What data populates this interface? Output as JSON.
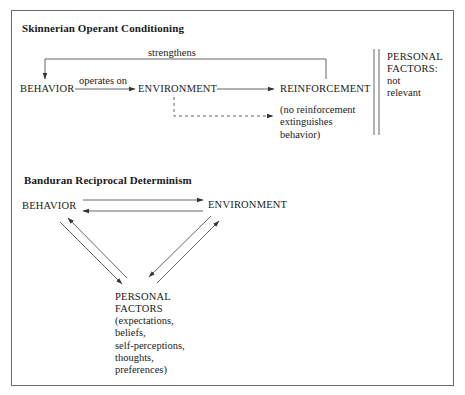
{
  "skinner": {
    "title": "Skinnerian Operant Conditioning",
    "nodes": {
      "behavior": "BEHAVIOR",
      "environment": "ENVIRONMENT",
      "reinforcement": "REINFORCEMENT"
    },
    "edges": {
      "behavior_to_environment": "operates on",
      "reinforcement_to_behavior": "strengthens",
      "environment_to_no_reinforcement": "(no reinforcement\nextinguishes\nbehavior)"
    },
    "personal_factors": {
      "label": "PERSONAL\nFACTORS:",
      "note": "not\nrelevant"
    }
  },
  "bandura": {
    "title": "Banduran Reciprocal Determinism",
    "nodes": {
      "behavior": "BEHAVIOR",
      "environment": "ENVIRONMENT",
      "personal_factors_label": "PERSONAL\nFACTORS",
      "personal_factors_detail": "(expectations,\nbeliefs,\nself-perceptions,\nthoughts,\npreferences)"
    }
  },
  "colors": {
    "line": "#555555",
    "text": "#1a1a1a",
    "frame": "#6a6a6a"
  }
}
